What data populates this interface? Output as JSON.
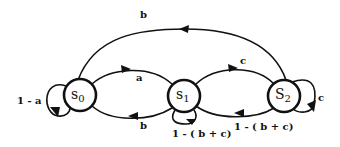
{
  "diagram": {
    "type": "state-transition-diagram",
    "colors": {
      "stroke": "#111111",
      "background": "#ffffff"
    },
    "states": [
      {
        "id": "s0",
        "label": "s",
        "subscript": "0"
      },
      {
        "id": "s1",
        "label": "s",
        "subscript": "1"
      },
      {
        "id": "s2",
        "label": "S",
        "subscript": "2"
      }
    ],
    "transitions": [
      {
        "from": "s0",
        "to": "s0",
        "label": "1 - a"
      },
      {
        "from": "s0",
        "to": "s1",
        "label": "a"
      },
      {
        "from": "s1",
        "to": "s0",
        "label": "b"
      },
      {
        "from": "s1",
        "to": "s1",
        "label": "1 - ( b + c)"
      },
      {
        "from": "s1",
        "to": "s2",
        "label": "c"
      },
      {
        "from": "s2",
        "to": "s1",
        "label": "1 - ( b + c)"
      },
      {
        "from": "s2",
        "to": "s2",
        "label": "c"
      },
      {
        "from": "s2",
        "to": "s0",
        "label": "b"
      }
    ]
  }
}
